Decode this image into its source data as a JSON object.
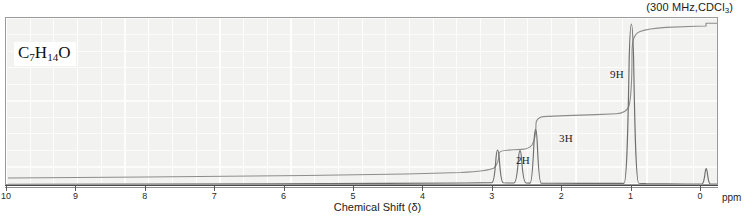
{
  "header": {
    "conditions_prefix": "(300 MHz,CDCl",
    "conditions_sub": "3",
    "conditions_suffix": ")",
    "conditions_full": "(300 MHz,CDCl3)"
  },
  "formula": {
    "c": "C",
    "c_count": "7",
    "h": "H",
    "h_count": "14",
    "o": "O"
  },
  "axis": {
    "xlabel": "Chemical Shift (δ)",
    "unit": "ppm",
    "ticks": [
      "10",
      "9",
      "8",
      "7",
      "6",
      "5",
      "4",
      "3",
      "2",
      "1",
      "0"
    ]
  },
  "integrals": {
    "a": "2H",
    "b": "3H",
    "c": "9H"
  },
  "chart_data": {
    "type": "line",
    "title": "",
    "subtitle": "(300 MHz,CDCl3)",
    "xlabel": "Chemical Shift (δ)",
    "ylabel": "",
    "xunit": "ppm",
    "xlim": [
      10,
      0
    ],
    "ylim": [
      0,
      100
    ],
    "grid": true,
    "legend": "none",
    "annotations": [
      {
        "text": "C7H14O",
        "x": 9.8,
        "y": 92
      },
      {
        "text": "(300 MHz,CDCl3)",
        "x": 0.6,
        "y": 105
      },
      {
        "text": "2H",
        "x": 2.45,
        "y": 22
      },
      {
        "text": "3H",
        "x": 2.05,
        "y": 35
      },
      {
        "text": "9H",
        "x": 1.32,
        "y": 72
      }
    ],
    "series": [
      {
        "name": "1H NMR spectrum",
        "kind": "spectrum",
        "peaks": [
          {
            "shift": 2.33,
            "height": 19,
            "width": 0.035,
            "protons": 2,
            "label": "2H"
          },
          {
            "shift": 2.13,
            "height": 26,
            "width": 0.03,
            "protons": 3,
            "label": "3H"
          },
          {
            "shift": 1.02,
            "height": 98,
            "width": 0.03,
            "protons": 9,
            "label": "9H"
          },
          {
            "shift": 0.0,
            "height": 6,
            "width": 0.02,
            "protons": 0,
            "label": "TMS"
          }
        ]
      },
      {
        "name": "integral trace",
        "kind": "integral",
        "steps": [
          {
            "shift": 2.33,
            "rise": 13,
            "cumulative": 14,
            "protons": 2
          },
          {
            "shift": 2.13,
            "rise": 21,
            "cumulative": 35,
            "protons": 3
          },
          {
            "shift": 1.02,
            "rise": 57,
            "cumulative": 92,
            "protons": 9
          }
        ]
      }
    ]
  }
}
